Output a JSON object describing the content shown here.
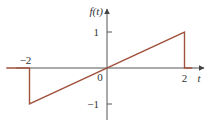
{
  "chart_data": {
    "type": "line",
    "title": "",
    "xlabel": "t",
    "ylabel": "f(t)",
    "xlim": [
      -2.5,
      2.5
    ],
    "ylim": [
      -1.3,
      1.5
    ],
    "grid": false,
    "legend": "none",
    "series": [
      {
        "name": "f(t)",
        "color": "#a0523c",
        "points": [
          {
            "x": -2.6,
            "y": 0
          },
          {
            "x": -2,
            "y": 0
          },
          {
            "x": -2,
            "y": -1
          },
          {
            "x": 2,
            "y": 1
          },
          {
            "x": 2,
            "y": 0
          },
          {
            "x": 2.2,
            "y": 0
          }
        ]
      }
    ],
    "x_ticks": [
      {
        "value": -2,
        "label": "−2",
        "position": "above"
      },
      {
        "value": 0,
        "label": "0",
        "position": "below-left"
      },
      {
        "value": 2,
        "label": "2",
        "position": "below"
      }
    ],
    "y_ticks": [
      {
        "value": 1,
        "label": "1"
      },
      {
        "value": -1,
        "label": "−1"
      }
    ],
    "axis_color": "#555555"
  }
}
